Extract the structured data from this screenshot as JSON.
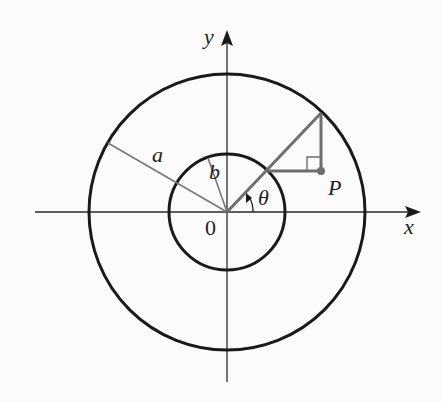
{
  "diagram": {
    "type": "polar-concentric-circles",
    "labels": {
      "y_axis": "y",
      "x_axis": "x",
      "origin": "0",
      "outer_radius": "a",
      "inner_radius": "b",
      "angle": "θ",
      "point": "P"
    },
    "colors": {
      "background": "#fbfbfb",
      "circle_stroke": "#1a1a1a",
      "axis_stroke": "#2a2a2a",
      "construction_stroke": "#6e6e6e",
      "radius_line_stroke": "#777777"
    },
    "geometry": {
      "origin": [
        227,
        212
      ],
      "outer_circle_radius": 138,
      "inner_circle_radius": 58,
      "theta_degrees": 45
    }
  }
}
